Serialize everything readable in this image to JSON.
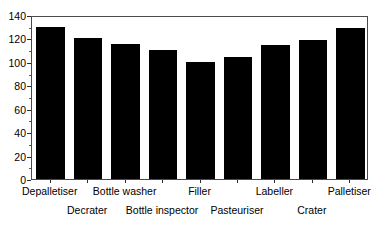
{
  "chart_data": {
    "type": "bar",
    "title": "",
    "subtitle": "",
    "xlabel": "",
    "ylabel": "",
    "categories": [
      "Depalletiser",
      "Decrater",
      "Bottle washer",
      "Bottle inspector",
      "Filler",
      "Pasteuriser",
      "Labeller",
      "Crater",
      "Palletiser"
    ],
    "values": [
      130,
      120,
      115,
      110,
      100,
      104,
      114,
      119,
      129
    ],
    "ylim": [
      0,
      140
    ],
    "ytick_labels": [
      "0",
      "20",
      "40",
      "60",
      "80",
      "100",
      "120",
      "140"
    ],
    "ytick_values": [
      0,
      20,
      40,
      60,
      80,
      100,
      120,
      140
    ],
    "minor_tick_step": 10,
    "grid": false,
    "legend": false,
    "legend_position": "none",
    "bar_color": "#000000",
    "frame_color": "#4a4a4a",
    "background_color": "#ffffff",
    "label_layout": "staggered-two-rows"
  }
}
